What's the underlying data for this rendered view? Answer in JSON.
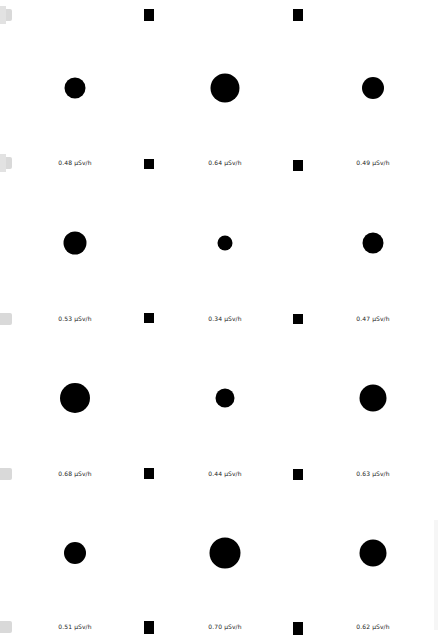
{
  "map": {
    "unit": "µSv/h",
    "symbol_color": "#000000",
    "background_color": "#ffffff",
    "edge_tab_color": "#d9d9d9",
    "columns_x": [
      75,
      225,
      373
    ],
    "rows_y": [
      88,
      243,
      398,
      553
    ],
    "label_rows_y": [
      163,
      319,
      474,
      627
    ],
    "readings": [
      {
        "row": 0,
        "col": 0,
        "value": 0.48,
        "label": "0.48 µSv/h",
        "diameter": 21
      },
      {
        "row": 0,
        "col": 1,
        "value": 0.64,
        "label": "0.64 µSv/h",
        "diameter": 29
      },
      {
        "row": 0,
        "col": 2,
        "value": 0.49,
        "label": "0.49 µSv/h",
        "diameter": 22
      },
      {
        "row": 1,
        "col": 0,
        "value": 0.53,
        "label": "0.53 µSv/h",
        "diameter": 23
      },
      {
        "row": 1,
        "col": 1,
        "value": 0.34,
        "label": "0.34 µSv/h",
        "diameter": 15
      },
      {
        "row": 1,
        "col": 2,
        "value": 0.47,
        "label": "0.47 µSv/h",
        "diameter": 21
      },
      {
        "row": 2,
        "col": 0,
        "value": 0.68,
        "label": "0.68 µSv/h",
        "diameter": 30
      },
      {
        "row": 2,
        "col": 1,
        "value": 0.44,
        "label": "0.44 µSv/h",
        "diameter": 19
      },
      {
        "row": 2,
        "col": 2,
        "value": 0.63,
        "label": "0.63 µSv/h",
        "diameter": 27
      },
      {
        "row": 3,
        "col": 0,
        "value": 0.51,
        "label": "0.51 µSv/h",
        "diameter": 22
      },
      {
        "row": 3,
        "col": 1,
        "value": 0.7,
        "label": "0.70 µSv/h",
        "diameter": 31
      },
      {
        "row": 3,
        "col": 2,
        "value": 0.62,
        "label": "0.62 µSv/h",
        "diameter": 27
      }
    ],
    "square_markers": [
      {
        "x": 144,
        "y": 9,
        "w": 10,
        "h": 12
      },
      {
        "x": 293,
        "y": 9,
        "w": 10,
        "h": 12
      },
      {
        "x": 144,
        "y": 159,
        "w": 10,
        "h": 10
      },
      {
        "x": 293,
        "y": 160,
        "w": 10,
        "h": 11
      },
      {
        "x": 144,
        "y": 313,
        "w": 10,
        "h": 10
      },
      {
        "x": 293,
        "y": 314,
        "w": 10,
        "h": 10
      },
      {
        "x": 144,
        "y": 468,
        "w": 10,
        "h": 11
      },
      {
        "x": 293,
        "y": 469,
        "w": 10,
        "h": 11
      },
      {
        "x": 144,
        "y": 621,
        "w": 10,
        "h": 13
      },
      {
        "x": 293,
        "y": 622,
        "w": 10,
        "h": 13
      }
    ],
    "edge_tabs": [
      {
        "y": 9,
        "plus": true
      },
      {
        "y": 157,
        "plus": true
      },
      {
        "y": 313,
        "plus": false
      },
      {
        "y": 468,
        "plus": false
      },
      {
        "y": 621,
        "plus": false
      }
    ]
  }
}
